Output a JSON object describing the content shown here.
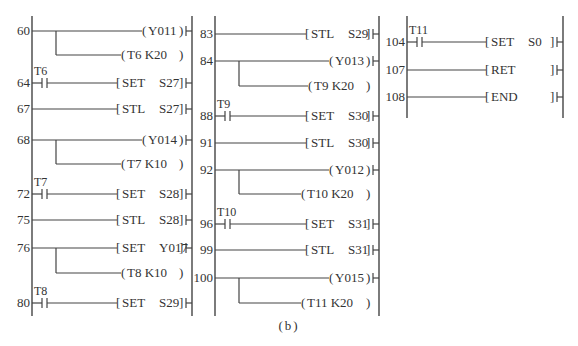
{
  "caption": "(b)",
  "colors": {
    "line": "#444444",
    "text": "#333333",
    "background": "#ffffff"
  },
  "sections": [
    {
      "left_rail_x": 32,
      "right_rail_x": 192,
      "rail_top": 16,
      "rail_bottom": 316,
      "instr_x": 117,
      "rungs": [
        {
          "step": "60",
          "y": 31,
          "contact": null,
          "type": "coil",
          "operand": "Y011",
          "branch": {
            "y": 55,
            "type": "coil",
            "operand": "T6  K20"
          }
        },
        {
          "step": "64",
          "y": 83,
          "contact": "T6",
          "type": "func",
          "op": "SET",
          "operand": "S27"
        },
        {
          "step": "67",
          "y": 109,
          "contact": null,
          "type": "func",
          "op": "STL",
          "operand": "S27"
        },
        {
          "step": "68",
          "y": 140,
          "contact": null,
          "type": "coil",
          "operand": "Y014",
          "branch": {
            "y": 164,
            "type": "coil",
            "operand": "T7  K10"
          }
        },
        {
          "step": "72",
          "y": 194,
          "contact": "T7",
          "type": "func",
          "op": "SET",
          "operand": "S28"
        },
        {
          "step": "75",
          "y": 220,
          "contact": null,
          "type": "func",
          "op": "STL",
          "operand": "S28"
        },
        {
          "step": "76",
          "y": 248,
          "contact": null,
          "type": "func",
          "op": "SET",
          "operand": "Y017",
          "branch": {
            "y": 273,
            "type": "coil",
            "operand": "T8  K10"
          }
        },
        {
          "step": "80",
          "y": 303,
          "contact": "T8",
          "type": "func",
          "op": "SET",
          "operand": "S29"
        }
      ]
    },
    {
      "left_rail_x": 215,
      "right_rail_x": 379,
      "rail_top": 16,
      "rail_bottom": 316,
      "instr_x": 306,
      "rungs": [
        {
          "step": "83",
          "y": 34,
          "contact": null,
          "type": "func",
          "op": "STL",
          "operand": "S29"
        },
        {
          "step": "84",
          "y": 61,
          "contact": null,
          "type": "coil",
          "operand": "Y013",
          "branch": {
            "y": 86,
            "type": "coil",
            "operand": "T9  K20"
          }
        },
        {
          "step": "88",
          "y": 116,
          "contact": "T9",
          "type": "func",
          "op": "SET",
          "operand": "S30"
        },
        {
          "step": "91",
          "y": 143,
          "contact": null,
          "type": "func",
          "op": "STL",
          "operand": "S30"
        },
        {
          "step": "92",
          "y": 170,
          "contact": null,
          "type": "coil",
          "operand": "Y012",
          "branch": {
            "y": 194,
            "type": "coil",
            "operand": "T10  K20"
          }
        },
        {
          "step": "96",
          "y": 224,
          "contact": "T10",
          "type": "func",
          "op": "SET",
          "operand": "S31"
        },
        {
          "step": "99",
          "y": 250,
          "contact": null,
          "type": "func",
          "op": "STL",
          "operand": "S31"
        },
        {
          "step": "100",
          "y": 278,
          "contact": null,
          "type": "coil",
          "operand": "Y015",
          "branch": {
            "y": 303,
            "type": "coil",
            "operand": "T11  K20"
          }
        }
      ]
    },
    {
      "left_rail_x": 407,
      "right_rail_x": 563,
      "rail_top": 16,
      "rail_bottom": 118,
      "instr_x": 486,
      "rungs": [
        {
          "step": "104",
          "y": 42,
          "contact": "T11",
          "type": "func",
          "op": "SET",
          "operand": "S0"
        },
        {
          "step": "107",
          "y": 70,
          "contact": null,
          "type": "func",
          "op": "RET",
          "operand": ""
        },
        {
          "step": "108",
          "y": 97,
          "contact": null,
          "type": "func",
          "op": "END",
          "operand": ""
        }
      ]
    }
  ]
}
